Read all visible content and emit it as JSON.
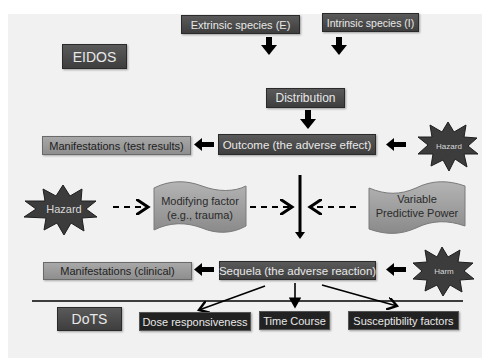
{
  "diagram": {
    "frameworks": {
      "top": "EIDOS",
      "bottom": "DoTS"
    },
    "species": {
      "extrinsic": "Extrinsic species (E)",
      "intrinsic": "Intrinsic species (I)"
    },
    "distribution": "Distribution",
    "outcome": "Outcome (the adverse effect)",
    "manifestations_test": "Manifestations (test results)",
    "hazard_right": "Hazard",
    "hazard_left": "Hazard",
    "modifying_factor": {
      "line1": "Modifying factor",
      "line2": "(e.g., trauma)"
    },
    "variable_predictive_power": {
      "line1": "Variable",
      "line2": "Predictive Power"
    },
    "sequela": "Sequela (the adverse reaction)",
    "manifestations_clinical": "Manifestations (clinical)",
    "harm": "Harm",
    "dots_items": [
      "Dose responsiveness",
      "Time Course",
      "Susceptibility factors"
    ]
  },
  "colors": {
    "background": "#f1f1f1",
    "dark_box": "#4a4a4a",
    "light_box": "#9a9a9a",
    "wave": "#a0a0a0",
    "star": "#3c3c3c",
    "arrow": "#000000"
  }
}
